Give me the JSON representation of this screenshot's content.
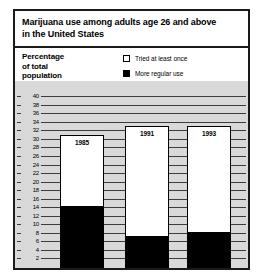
{
  "chart_data": {
    "type": "bar",
    "title": "Marijuana use among adults age 26 and above in the United States",
    "title_lines": [
      "Marijuana use among adults age 26 and above",
      "in the United States"
    ],
    "xlabel": "",
    "ylabel": "Percentage of total population",
    "ylabel_lines": [
      "Percentage",
      "of total",
      "population"
    ],
    "ylim": [
      0,
      41
    ],
    "yticks": [
      2,
      4,
      6,
      8,
      10,
      12,
      14,
      16,
      18,
      20,
      22,
      24,
      26,
      28,
      30,
      32,
      34,
      36,
      38,
      40
    ],
    "grid": true,
    "legend_position": "top-right",
    "stacked": true,
    "categories": [
      "1985",
      "1991",
      "1993"
    ],
    "series": [
      {
        "name": "Tried at least once",
        "color": "#ffffff",
        "values": [
          31,
          33,
          33
        ]
      },
      {
        "name": "More regular use",
        "color": "#000000",
        "values": [
          14,
          7,
          8
        ]
      }
    ]
  },
  "legend": {
    "items": [
      {
        "label": "Tried at least once",
        "swatch": "hollow"
      },
      {
        "label": "More regular use",
        "swatch": "filled"
      }
    ]
  }
}
